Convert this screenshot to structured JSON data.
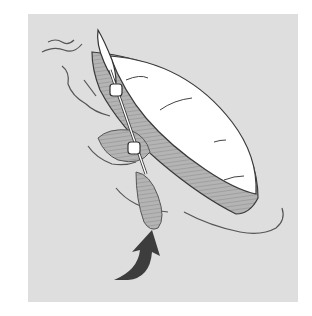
{
  "illustration": {
    "subject": "kayak capsized with paddle raised, arrow indicating roll direction",
    "caption": "",
    "colors": {
      "background": "#ffffff",
      "panel": "#dedede",
      "hull": "#ffffff",
      "outline": "#3a3a3a",
      "shade": "#9a9a9a",
      "arrow": "#3d3d3d"
    },
    "elements": [
      "kayak-hull",
      "paddle",
      "paddler-arm",
      "water-ripples",
      "roll-arrow"
    ]
  }
}
